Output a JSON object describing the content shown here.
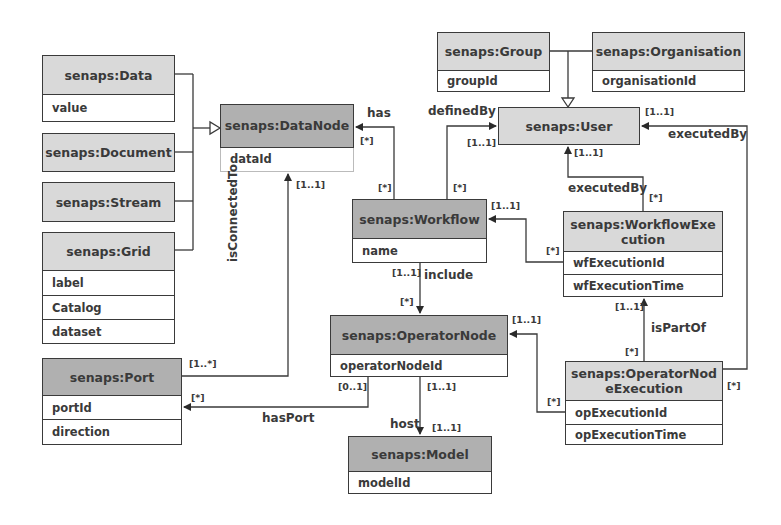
{
  "diagram": {
    "type": "UML class diagram",
    "classes": {
      "data": {
        "name": "senaps:Data",
        "attributes": [
          "value"
        ]
      },
      "document": {
        "name": "senaps:Document",
        "attributes": []
      },
      "stream": {
        "name": "senaps:Stream",
        "attributes": []
      },
      "grid": {
        "name": "senaps:Grid",
        "attributes": [
          "label",
          "Catalog",
          "dataset"
        ]
      },
      "datanode": {
        "name": "senaps:DataNode",
        "attributes": [
          "dataId"
        ]
      },
      "port": {
        "name": "senaps:Port",
        "attributes": [
          "portId",
          "direction"
        ]
      },
      "group": {
        "name": "senaps:Group",
        "attributes": [
          "groupId"
        ]
      },
      "organisation": {
        "name": "senaps:Organisation",
        "attributes": [
          "organisationId"
        ]
      },
      "user": {
        "name": "senaps:User",
        "attributes": []
      },
      "workflow": {
        "name": "senaps:Workflow",
        "attributes": [
          "name"
        ]
      },
      "workflowexecution": {
        "name": "senaps:WorkflowExecution",
        "name_line1": "senaps:WorkflowExe",
        "name_line2": "cution",
        "attributes": [
          "wfExecutionId",
          "wfExecutionTime"
        ]
      },
      "operatornode": {
        "name": "senaps:OperatorNode",
        "attributes": [
          "operatorNodeId"
        ]
      },
      "operatornodeexecution": {
        "name": "senaps:OperatorNodeExecution",
        "name_line1": "senaps:OperatorNod",
        "name_line2": "eExecution",
        "attributes": [
          "opExecutionId",
          "opExecutionTime"
        ]
      },
      "model": {
        "name": "senaps:Model",
        "attributes": [
          "modelId"
        ]
      }
    },
    "relations": {
      "has": {
        "label": "has",
        "from": "senaps:Workflow",
        "to": "senaps:DataNode",
        "from_mult": "[*]",
        "to_mult": "[*]"
      },
      "definedBy": {
        "label": "definedBy",
        "from": "senaps:Workflow",
        "to": "senaps:User",
        "from_mult": "[*]",
        "to_mult": "[1..1]"
      },
      "executedBy_wf": {
        "label": "executedBy",
        "from": "senaps:WorkflowExecution",
        "to": "senaps:User",
        "from_mult": "[*]",
        "to_mult": "[1..1]"
      },
      "executedBy_op": {
        "label": "executedBy",
        "from": "senaps:OperatorNodeExecution",
        "to": "senaps:User",
        "from_mult": "[*]",
        "to_mult": "[1..1]"
      },
      "wfexec_workflow": {
        "label": "",
        "from": "senaps:WorkflowExecution",
        "to": "senaps:Workflow",
        "from_mult": "[*]",
        "to_mult": "[1..1]"
      },
      "include": {
        "label": "include",
        "from": "senaps:Workflow",
        "to": "senaps:OperatorNode",
        "from_mult": "[1..1]",
        "to_mult": "[*]"
      },
      "isConnectedTo": {
        "label": "isConnectedTo",
        "from": "senaps:Port",
        "to": "senaps:DataNode",
        "from_mult": "[1..*]",
        "to_mult": "[1..1]"
      },
      "hasPort": {
        "label": "hasPort",
        "from": "senaps:OperatorNode",
        "to": "senaps:Port",
        "from_mult": "[0..1]",
        "to_mult": "[*]"
      },
      "host": {
        "label": "host",
        "from": "senaps:OperatorNode",
        "to": "senaps:Model",
        "from_mult": "[1..1]",
        "to_mult": "[1..1]"
      },
      "isPartOf": {
        "label": "isPartOf",
        "from": "senaps:OperatorNodeExecution",
        "to": "senaps:WorkflowExecution",
        "from_mult": "[*]",
        "to_mult": "[1..1]"
      },
      "opexec_opnode": {
        "label": "",
        "from": "senaps:OperatorNodeExecution",
        "to": "senaps:OperatorNode",
        "from_mult": "[*]",
        "to_mult": "[1..1]"
      }
    },
    "generalizations": [
      {
        "parent": "senaps:DataNode",
        "children": [
          "senaps:Data",
          "senaps:Document",
          "senaps:Stream",
          "senaps:Grid"
        ]
      },
      {
        "parent": "senaps:User",
        "children": [
          "senaps:Group",
          "senaps:Organisation"
        ]
      }
    ],
    "colors": {
      "header_light": "#d9d9d9",
      "header_dark": "#b0b0b0",
      "line": "#3a3a3a",
      "background": "#ffffff"
    }
  }
}
